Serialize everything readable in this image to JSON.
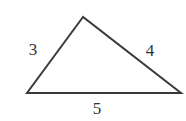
{
  "diagram": {
    "shape": "triangle",
    "stroke_color": "#3a3a3a",
    "sides": [
      {
        "id": "left",
        "label": "3"
      },
      {
        "id": "right",
        "label": "4"
      },
      {
        "id": "bottom",
        "label": "5"
      }
    ]
  }
}
